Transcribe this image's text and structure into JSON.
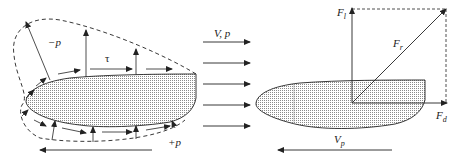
{
  "diagram": {
    "left_panel": {
      "labels": {
        "suction": "−p",
        "shear": "τ",
        "pressure": "+p"
      }
    },
    "middle": {
      "flow_label": "V, p",
      "flow_arrow_count": 5
    },
    "right_panel": {
      "labels": {
        "lift_main": "F",
        "lift_sub": "l",
        "resultant_main": "F",
        "resultant_sub": "r",
        "drag_main": "F",
        "drag_sub": "d",
        "velocity_main": "V",
        "velocity_sub": "p"
      }
    },
    "colors": {
      "line": "#222222",
      "hatch": "#9a9a9a",
      "background": "#ffffff"
    }
  }
}
